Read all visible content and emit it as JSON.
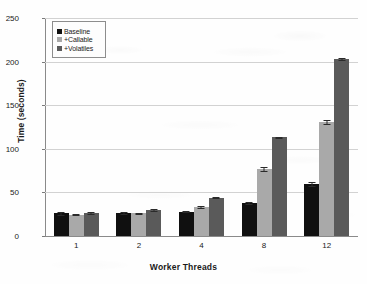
{
  "chart_data": {
    "type": "bar",
    "title": "",
    "xlabel": "Worker Threads",
    "ylabel": "Time (seconds)",
    "categories": [
      "1",
      "2",
      "4",
      "8",
      "12"
    ],
    "ylim": [
      0,
      250
    ],
    "yticks": [
      0,
      50,
      100,
      150,
      200,
      250
    ],
    "grid": true,
    "legend_position": "upper-left-inside",
    "error_bars": true,
    "series": [
      {
        "name": "Baseline",
        "color": "#101010",
        "values": [
          26,
          26.5,
          28,
          38,
          59.5
        ],
        "errors": [
          1.6,
          0.8,
          1.0,
          1.2,
          2.2
        ]
      },
      {
        "name": "+Callable",
        "color": "#a9a9a9",
        "values": [
          24.5,
          26,
          33,
          77,
          131
        ],
        "errors": [
          0.9,
          0.8,
          1.2,
          2.0,
          2.0
        ]
      },
      {
        "name": "+Volatiles",
        "color": "#5a5a5a",
        "values": [
          26,
          30,
          44,
          113,
          203
        ],
        "errors": [
          1.0,
          0.8,
          0.8,
          1.0,
          1.5
        ]
      }
    ]
  },
  "legend": {
    "items": [
      {
        "label": "Baseline",
        "color": "#101010"
      },
      {
        "label": "+Callable",
        "color": "#a9a9a9"
      },
      {
        "label": "+Volatiles",
        "color": "#5a5a5a"
      }
    ]
  }
}
